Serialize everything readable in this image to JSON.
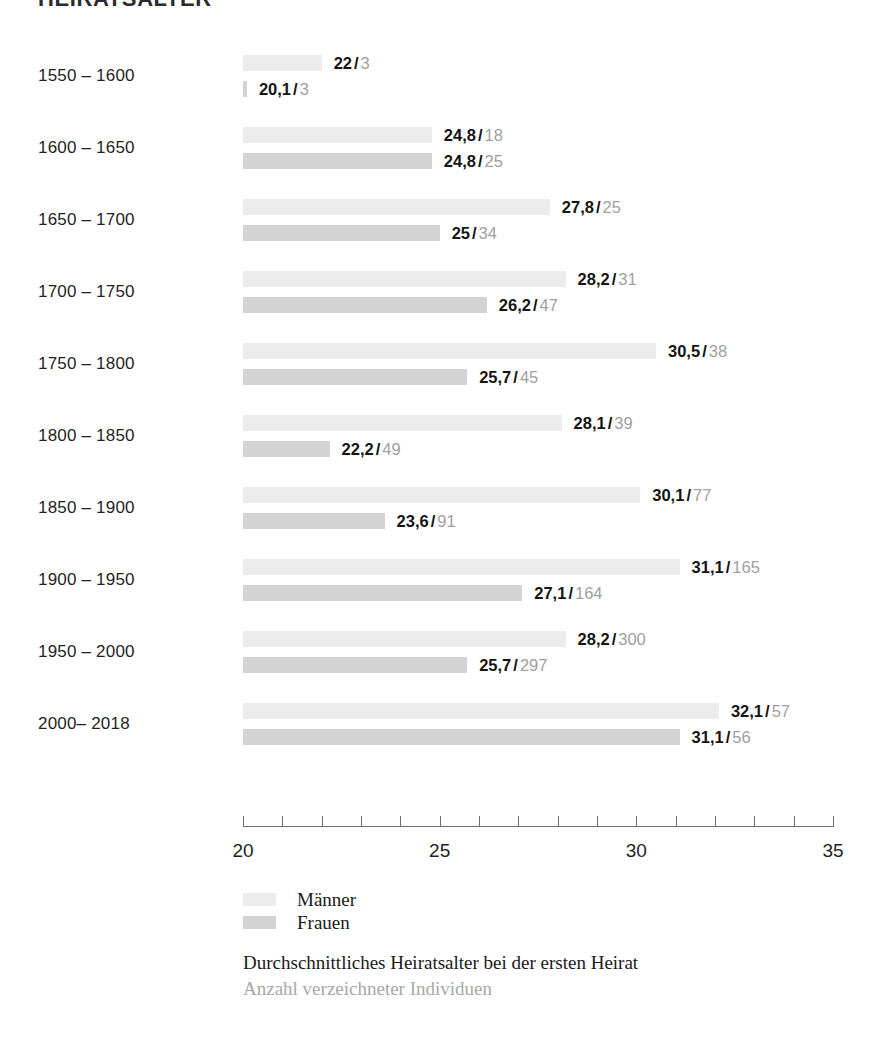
{
  "title": "HEIRATSALTER",
  "axis": {
    "ticks": [
      20,
      21,
      22,
      23,
      24,
      25,
      26,
      27,
      28,
      29,
      30,
      31,
      32,
      33,
      34,
      35
    ],
    "labeled_ticks": [
      {
        "value": 20,
        "label": "20"
      },
      {
        "value": 25,
        "label": "25"
      },
      {
        "value": 30,
        "label": "30"
      },
      {
        "value": 35,
        "label": "35"
      }
    ],
    "min": 20,
    "max": 35
  },
  "legend": {
    "position": "bottom-left",
    "items": [
      {
        "label": "Männer",
        "color": "#ececec"
      },
      {
        "label": "Frauen",
        "color": "#d3d3d3"
      }
    ]
  },
  "caption": {
    "primary": "Durchschnittliches Heiratsalter bei der ersten Heirat",
    "secondary": "Anzahl verzeichneter Individuen"
  },
  "separator": "/",
  "chart_data": {
    "type": "bar",
    "title": "HEIRATSALTER",
    "xlabel": "",
    "ylabel": "",
    "xlim": [
      20,
      35
    ],
    "grid": false,
    "orientation": "horizontal",
    "categories": [
      "1550 – 1600",
      "1600 – 1650",
      "1650 – 1700",
      "1700 – 1750",
      "1750 – 1800",
      "1800 – 1850",
      "1850 – 1900",
      "1900 – 1950",
      "1950 – 2000",
      "2000– 2018"
    ],
    "series": [
      {
        "name": "Männer",
        "color": "#ececec",
        "values": [
          22,
          24.8,
          27.8,
          28.2,
          30.5,
          28.1,
          30.1,
          31.1,
          28.2,
          32.1
        ],
        "labels": [
          "22",
          "24,8",
          "27,8",
          "28,2",
          "30,5",
          "28,1",
          "30,1",
          "31,1",
          "28,2",
          "32,1"
        ],
        "counts": [
          3,
          18,
          25,
          31,
          38,
          39,
          77,
          165,
          300,
          57
        ]
      },
      {
        "name": "Frauen",
        "color": "#d3d3d3",
        "values": [
          20.1,
          24.8,
          25,
          26.2,
          25.7,
          22.2,
          23.6,
          27.1,
          25.7,
          31.1
        ],
        "labels": [
          "20,1",
          "24,8",
          "25",
          "26,2",
          "25,7",
          "22,2",
          "23,6",
          "27,1",
          "25,7",
          "31,1"
        ],
        "counts": [
          3,
          25,
          34,
          47,
          45,
          49,
          91,
          164,
          297,
          56
        ]
      }
    ]
  },
  "rows": [
    {
      "label": "1550 – 1600",
      "men": {
        "value": 22,
        "value_label": "22",
        "count": "3"
      },
      "women": {
        "value": 20.1,
        "value_label": "20,1",
        "count": "3"
      }
    },
    {
      "label": "1600 – 1650",
      "men": {
        "value": 24.8,
        "value_label": "24,8",
        "count": "18"
      },
      "women": {
        "value": 24.8,
        "value_label": "24,8",
        "count": "25"
      }
    },
    {
      "label": "1650 – 1700",
      "men": {
        "value": 27.8,
        "value_label": "27,8",
        "count": "25"
      },
      "women": {
        "value": 25,
        "value_label": "25",
        "count": "34"
      }
    },
    {
      "label": "1700 – 1750",
      "men": {
        "value": 28.2,
        "value_label": "28,2",
        "count": "31"
      },
      "women": {
        "value": 26.2,
        "value_label": "26,2",
        "count": "47"
      }
    },
    {
      "label": "1750 – 1800",
      "men": {
        "value": 30.5,
        "value_label": "30,5",
        "count": "38"
      },
      "women": {
        "value": 25.7,
        "value_label": "25,7",
        "count": "45"
      }
    },
    {
      "label": "1800 – 1850",
      "men": {
        "value": 28.1,
        "value_label": "28,1",
        "count": "39"
      },
      "women": {
        "value": 22.2,
        "value_label": "22,2",
        "count": "49"
      }
    },
    {
      "label": "1850 – 1900",
      "men": {
        "value": 30.1,
        "value_label": "30,1",
        "count": "77"
      },
      "women": {
        "value": 23.6,
        "value_label": "23,6",
        "count": "91"
      }
    },
    {
      "label": "1900 – 1950",
      "men": {
        "value": 31.1,
        "value_label": "31,1",
        "count": "165"
      },
      "women": {
        "value": 27.1,
        "value_label": "27,1",
        "count": "164"
      }
    },
    {
      "label": "1950 – 2000",
      "men": {
        "value": 28.2,
        "value_label": "28,2",
        "count": "300"
      },
      "women": {
        "value": 25.7,
        "value_label": "25,7",
        "count": "297"
      }
    },
    {
      "label": "2000– 2018",
      "men": {
        "value": 32.1,
        "value_label": "32,1",
        "count": "57"
      },
      "women": {
        "value": 31.1,
        "value_label": "31,1",
        "count": "56"
      }
    }
  ]
}
